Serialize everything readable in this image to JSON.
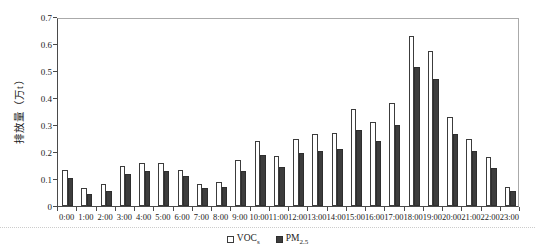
{
  "chart_data": {
    "type": "bar",
    "title": "",
    "xlabel": "",
    "ylabel": "排放量（万t）",
    "ylim": [
      0,
      0.7
    ],
    "ytick_labels": [
      "0",
      "0.1",
      "0.2",
      "0.3",
      "0.4",
      "0.5",
      "0.6",
      "0.7"
    ],
    "grid": false,
    "legend_position": "bottom-center",
    "categories": [
      "0:00",
      "1:00",
      "2:00",
      "3:00",
      "4:00",
      "5:00",
      "6:00",
      "7:00",
      "8:00",
      "9:00",
      "10:00",
      "11:00",
      "12:00",
      "13:00",
      "14:00",
      "15:00",
      "16:00",
      "17:00",
      "18:00",
      "19:00",
      "20:00",
      "21:00",
      "22:00",
      "23:00"
    ],
    "series": [
      {
        "name": "VOC",
        "name_sub": "s",
        "fill": "#ffffff",
        "border": "#3c3c3c",
        "values": [
          0.135,
          0.065,
          0.08,
          0.15,
          0.16,
          0.16,
          0.135,
          0.08,
          0.09,
          0.17,
          0.24,
          0.185,
          0.25,
          0.265,
          0.27,
          0.36,
          0.31,
          0.38,
          0.63,
          0.575,
          0.33,
          0.25,
          0.18,
          0.07
        ]
      },
      {
        "name": "PM",
        "name_sub": "2.5",
        "fill": "#3d3d3d",
        "border": "#2e2e2e",
        "values": [
          0.105,
          0.045,
          0.055,
          0.12,
          0.13,
          0.13,
          0.11,
          0.065,
          0.07,
          0.13,
          0.19,
          0.145,
          0.195,
          0.205,
          0.21,
          0.28,
          0.24,
          0.3,
          0.515,
          0.47,
          0.265,
          0.205,
          0.14,
          0.055
        ]
      }
    ]
  },
  "colors": {
    "axis": "#4a4a4a",
    "frame": "#aaaaaa",
    "text": "#1a1a1a",
    "background": "#ffffff"
  }
}
